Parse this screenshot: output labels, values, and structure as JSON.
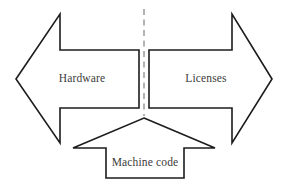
{
  "diagram": {
    "background_color": "#ffffff",
    "outline_color": "#1c1c1c",
    "label_color": "#3b3b3b",
    "divider_color": "#9a9a9a",
    "nodes": [
      {
        "id": "hardware",
        "label": "Hardware",
        "shape": "left-arrow",
        "direction": "left"
      },
      {
        "id": "licenses",
        "label": "Licenses",
        "shape": "right-arrow",
        "direction": "right"
      },
      {
        "id": "machine-code",
        "label": "Machine code",
        "shape": "up-arrow",
        "direction": "up"
      }
    ],
    "divider": {
      "id": "center-divider",
      "style": "dashed",
      "orientation": "vertical"
    }
  }
}
